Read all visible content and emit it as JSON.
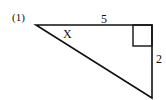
{
  "problem": {
    "number_label": "(1)"
  },
  "triangle": {
    "type": "right-triangle",
    "vertices": {
      "top_left": [
        36,
        25
      ],
      "top_right": [
        152,
        25
      ],
      "bottom_right": [
        152,
        98
      ]
    },
    "right_angle_at": "top_right",
    "labels": {
      "top_side": "5",
      "right_side": "2",
      "angle": "X"
    },
    "stroke_color": "#111111"
  }
}
